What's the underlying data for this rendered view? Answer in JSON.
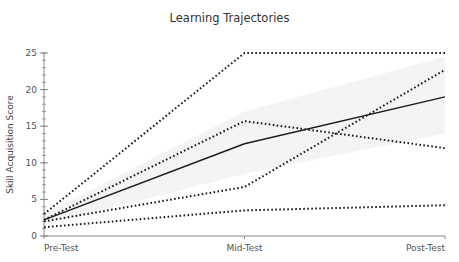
{
  "chart_data": {
    "type": "line",
    "title": "Learning Trajectories",
    "xlabel": "",
    "ylabel": "Skill Acquisition Score",
    "categories": [
      "Pre-Test",
      "Mid-Test",
      "Post-Test"
    ],
    "ylim": [
      0,
      25
    ],
    "yticks": [
      0,
      5,
      10,
      15,
      20,
      25
    ],
    "minor_tick_step": 1,
    "grid": false,
    "legend": null,
    "series": [
      {
        "name": "Mean trajectory",
        "style": "solid",
        "values": [
          2.2,
          12.6,
          19.0
        ]
      },
      {
        "name": "Individual 1",
        "style": "dotted",
        "values": [
          3.0,
          25.0,
          25.0
        ]
      },
      {
        "name": "Individual 2",
        "style": "dotted",
        "values": [
          2.2,
          15.7,
          12.0
        ]
      },
      {
        "name": "Individual 3",
        "style": "dotted",
        "values": [
          2.0,
          6.7,
          22.7
        ]
      },
      {
        "name": "Individual 4",
        "style": "dotted",
        "values": [
          1.2,
          3.5,
          4.2
        ]
      }
    ],
    "band": {
      "name": "Mean band",
      "lower": [
        1.5,
        8.5,
        14.0
      ],
      "upper": [
        3.0,
        17.0,
        24.5
      ],
      "color": "#f3f3f3"
    },
    "colors": {
      "line": "#1a1a1a",
      "axis": "#888888",
      "band": "#f3f3f3"
    }
  }
}
